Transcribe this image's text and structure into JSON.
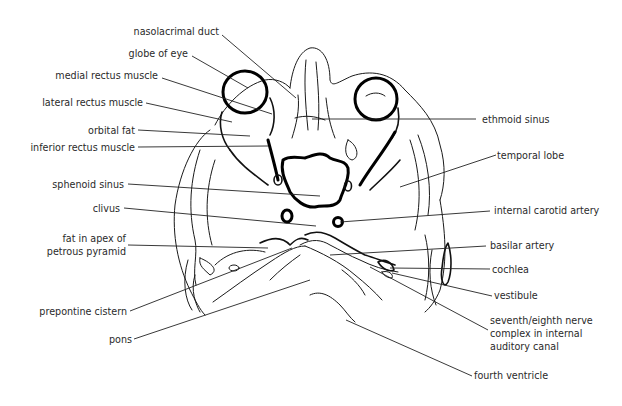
{
  "figure": {
    "labels_left": [
      {
        "id": "nasolacrimal-duct",
        "text": "nasolacrimal duct"
      },
      {
        "id": "globe-of-eye",
        "text": "globe of eye"
      },
      {
        "id": "medial-rectus-muscle",
        "text": "medial rectus muscle"
      },
      {
        "id": "lateral-rectus-muscle",
        "text": "lateral rectus muscle"
      },
      {
        "id": "orbital-fat",
        "text": "orbital fat"
      },
      {
        "id": "inferior-rectus-muscle",
        "text": "inferior rectus muscle"
      },
      {
        "id": "sphenoid-sinus",
        "text": "sphenoid sinus"
      },
      {
        "id": "clivus",
        "text": "clivus"
      },
      {
        "id": "fat-in-apex",
        "lines": [
          "fat in apex of",
          "petrous pyramid"
        ]
      },
      {
        "id": "prepontine-cistern",
        "text": "prepontine cistern"
      },
      {
        "id": "pons",
        "text": "pons"
      }
    ],
    "labels_right": [
      {
        "id": "ethmoid-sinus",
        "text": "ethmoid sinus"
      },
      {
        "id": "temporal-lobe",
        "text": "temporal lobe"
      },
      {
        "id": "internal-carotid-artery",
        "text": "internal carotid artery"
      },
      {
        "id": "basilar-artery",
        "text": "basilar artery"
      },
      {
        "id": "cochlea",
        "text": "cochlea"
      },
      {
        "id": "vestibule",
        "text": "vestibule"
      },
      {
        "id": "seventh-eighth-nerve",
        "lines": [
          "seventh/eighth nerve",
          "complex in internal",
          "auditory canal"
        ]
      },
      {
        "id": "fourth-ventricle",
        "text": "fourth ventricle"
      }
    ]
  }
}
